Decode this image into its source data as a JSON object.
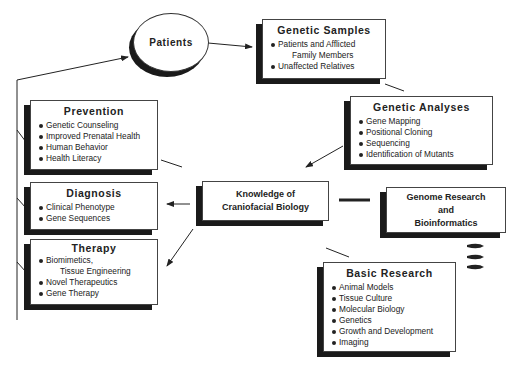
{
  "patients": {
    "label": "Patients"
  },
  "genetic_samples": {
    "title": "Genetic Samples",
    "items": [
      "Patients and Afflicted",
      "Family Members",
      "Unaffected Relatives"
    ]
  },
  "genetic_analyses": {
    "title": "Genetic Analyses",
    "items": [
      "Gene Mapping",
      "Positional Cloning",
      "Sequencing",
      "Identification of Mutants"
    ]
  },
  "knowledge": {
    "line1": "Knowledge of",
    "line2": "Craniofacial Biology"
  },
  "genome_research": {
    "line1": "Genome Research",
    "line2": "and",
    "line3": "Bioinformatics"
  },
  "basic_research": {
    "title": "Basic Research",
    "items": [
      "Animal Models",
      "Tissue Culture",
      "Molecular Biology",
      "Genetics",
      "Growth and Development",
      "Imaging"
    ]
  },
  "prevention": {
    "title": "Prevention",
    "items": [
      "Genetic Counseling",
      "Improved Prenatal Health",
      "Human Behavior",
      "Health Literacy"
    ]
  },
  "diagnosis": {
    "title": "Diagnosis",
    "items": [
      "Clinical Phenotype",
      "Gene Sequences"
    ]
  },
  "therapy": {
    "title": "Therapy",
    "items": [
      "Biomimetics,",
      "Tissue Engineering",
      "Novel Therapeutics",
      "Gene Therapy"
    ]
  }
}
